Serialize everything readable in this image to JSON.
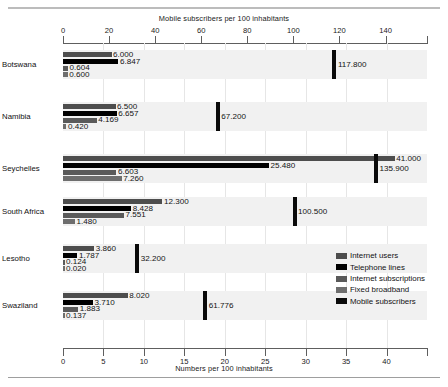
{
  "chart_data": {
    "type": "bar",
    "orientation": "horizontal",
    "title": "",
    "top_axis": {
      "label": "Mobile subscribers per 100 inhabitants",
      "ticks": [
        0,
        20,
        40,
        60,
        80,
        100,
        120,
        140
      ],
      "range": [
        0,
        158
      ]
    },
    "bottom_axis": {
      "label": "Numbers per 100 inhabitants",
      "ticks": [
        0,
        5,
        10,
        15,
        20,
        25,
        30,
        35,
        40
      ],
      "range": [
        0,
        45
      ]
    },
    "categories": [
      "Botswana",
      "Namibia",
      "Seychelles",
      "South Africa",
      "Lesotho",
      "Swaziland"
    ],
    "series": [
      {
        "name": "Internet users",
        "axis": "bottom",
        "color": "#4d4d4d",
        "values": [
          6.0,
          6.5,
          41.0,
          12.3,
          3.86,
          8.02
        ]
      },
      {
        "name": "Telephone lines",
        "axis": "bottom",
        "color": "#000000",
        "values": [
          6.847,
          6.657,
          25.48,
          8.428,
          1.787,
          3.71
        ]
      },
      {
        "name": "Internet subscriptions",
        "axis": "bottom",
        "color": "#5a5a5a",
        "values": [
          0.604,
          4.169,
          6.603,
          7.551,
          0.124,
          1.883
        ]
      },
      {
        "name": "Fixed broadband",
        "axis": "bottom",
        "color": "#6e6e6e",
        "values": [
          0.6,
          0.42,
          7.26,
          1.48,
          0.02,
          0.137
        ]
      },
      {
        "name": "Mobile subscribers",
        "axis": "top",
        "color": "#0a0a0a",
        "values": [
          117.8,
          67.2,
          135.9,
          100.5,
          32.2,
          61.776
        ]
      }
    ],
    "value_labels": {
      "Botswana": [
        "6.000",
        "6.847",
        "0.604",
        "0.600",
        "117.800"
      ],
      "Namibia": [
        "6.500",
        "6.657",
        "4.169",
        "0.420",
        "67.200"
      ],
      "Seychelles": [
        "41.000",
        "25.480",
        "6.603",
        "7.260",
        "135.900"
      ],
      "South Africa": [
        "12.300",
        "8.428",
        "7.551",
        "1.480",
        "100.500"
      ],
      "Lesotho": [
        "3.860",
        "1.787",
        "0.124",
        "0.020",
        "32.200"
      ],
      "Swaziland": [
        "8.020",
        "3.710",
        "1.883",
        "0.137",
        "61.776"
      ]
    },
    "legend": {
      "position": "bottom-right",
      "entries": [
        "Internet users",
        "Telephone lines",
        "Internet subscriptions",
        "Fixed broadband",
        "Mobile subscribers"
      ]
    },
    "grid": true
  }
}
